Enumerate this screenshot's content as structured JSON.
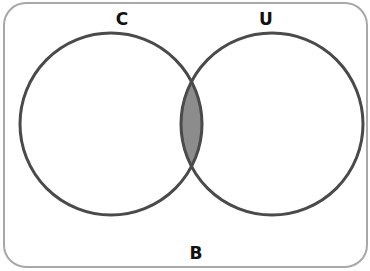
{
  "diagram": {
    "type": "venn",
    "universal_set_label": "B",
    "sets": [
      {
        "label": "C"
      },
      {
        "label": "U"
      }
    ],
    "shaded_region": "C ∩ U",
    "colors": {
      "outline": "#4a4a4a",
      "shade": "#8c8c8c",
      "frame": "#a8a8a8"
    }
  }
}
